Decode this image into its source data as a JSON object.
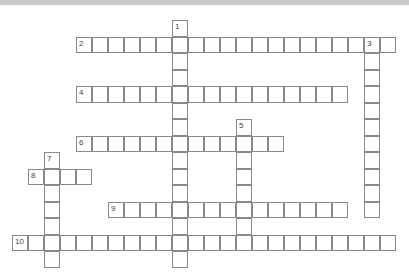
{
  "puzzle": {
    "cols": 24,
    "rows": 15,
    "cell_width": 16,
    "cell_height": 16.5,
    "border_color": "#8a8a8a",
    "words": [
      {
        "number": "1",
        "direction": "down",
        "row": 0,
        "col": 10,
        "length": 15
      },
      {
        "number": "2",
        "direction": "across",
        "row": 1,
        "col": 4,
        "length": 20
      },
      {
        "number": "3",
        "direction": "down",
        "row": 1,
        "col": 22,
        "length": 11
      },
      {
        "number": "4",
        "direction": "across",
        "row": 4,
        "col": 4,
        "length": 17
      },
      {
        "number": "5",
        "direction": "down",
        "row": 6,
        "col": 14,
        "length": 8
      },
      {
        "number": "6",
        "direction": "across",
        "row": 7,
        "col": 4,
        "length": 13
      },
      {
        "number": "7",
        "direction": "down",
        "row": 8,
        "col": 2,
        "length": 7
      },
      {
        "number": "8",
        "direction": "across",
        "row": 9,
        "col": 1,
        "length": 4
      },
      {
        "number": "9",
        "direction": "across",
        "row": 11,
        "col": 6,
        "length": 15
      },
      {
        "number": "10",
        "direction": "across",
        "row": 13,
        "col": 0,
        "length": 24
      }
    ]
  }
}
